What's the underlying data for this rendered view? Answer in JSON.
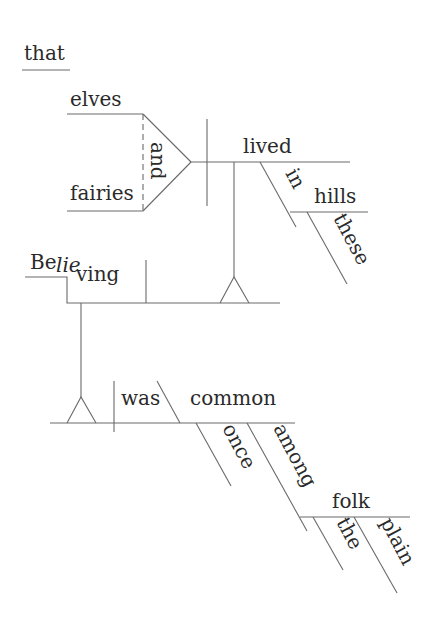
{
  "diagram": {
    "type": "Reed-Kellogg sentence diagram",
    "sentence_words": {
      "conjunction_that": "that",
      "subject_1": "elves",
      "coordinating_conjunction": "and",
      "subject_2": "fairies",
      "noun_clause_verb": "lived",
      "preposition_in": "in",
      "object_hills": "hills",
      "modifier_these": "these",
      "gerund_prefix": "Be",
      "gerund_stress": "lie",
      "gerund_suffix": "ving",
      "main_verb": "was",
      "predicate_adjective": "common",
      "adverb_once": "once",
      "preposition_among": "among",
      "object_folk": "folk",
      "modifier_the": "the",
      "modifier_plain": "plain"
    }
  }
}
